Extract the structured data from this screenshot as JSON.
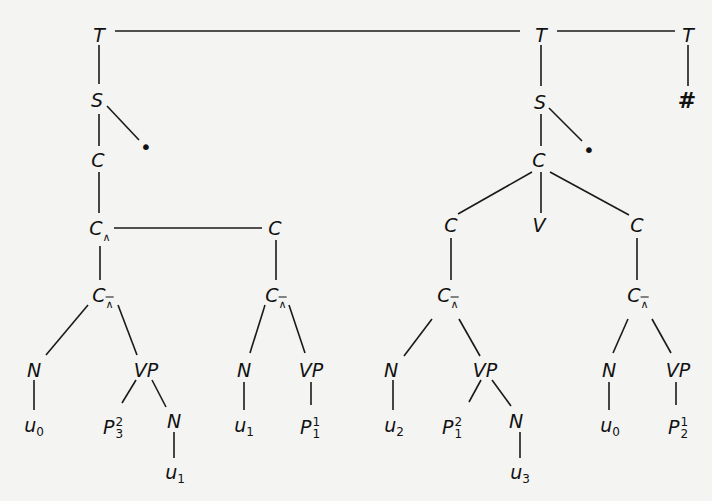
{
  "diagram": {
    "type": "tree",
    "edges_color": "#1a1a1a",
    "nodes": [
      {
        "id": "T1",
        "label": "T",
        "x": 99,
        "y": 35
      },
      {
        "id": "T2",
        "label": "T",
        "x": 541,
        "y": 35
      },
      {
        "id": "T3",
        "label": "T",
        "x": 688,
        "y": 35
      },
      {
        "id": "hash",
        "label": "#",
        "x": 687,
        "y": 101
      },
      {
        "id": "S1",
        "label": "S",
        "x": 97,
        "y": 100
      },
      {
        "id": "dot1",
        "label": "•",
        "x": 146,
        "y": 147
      },
      {
        "id": "C1",
        "label": "C",
        "x": 98,
        "y": 160
      },
      {
        "id": "Cw1",
        "label": "C",
        "sub": "∧",
        "x": 100,
        "y": 228
      },
      {
        "id": "C2",
        "label": "C",
        "x": 275,
        "y": 228
      },
      {
        "id": "Cwb1",
        "label": "C",
        "sub": "∧",
        "x": 103,
        "y": 295
      },
      {
        "id": "Cwb2",
        "label": "C",
        "sub": "∧",
        "x": 276,
        "y": 295
      },
      {
        "id": "N1",
        "label": "N",
        "x": 34,
        "y": 370
      },
      {
        "id": "VP1",
        "label": "VP",
        "x": 146,
        "y": 370
      },
      {
        "id": "u0a",
        "label": "u",
        "sub": "0",
        "x": 34,
        "y": 427
      },
      {
        "id": "P32",
        "label": "P",
        "sup": "2",
        "sub": "3",
        "x": 113,
        "y": 428
      },
      {
        "id": "N2",
        "label": "N",
        "x": 174,
        "y": 421
      },
      {
        "id": "u1a",
        "label": "u",
        "sub": "1",
        "x": 175,
        "y": 474
      },
      {
        "id": "N3",
        "label": "N",
        "x": 244,
        "y": 370
      },
      {
        "id": "VP2",
        "label": "VP",
        "x": 311,
        "y": 370
      },
      {
        "id": "u1b",
        "label": "u",
        "sub": "1",
        "x": 244,
        "y": 427
      },
      {
        "id": "P11",
        "label": "P",
        "sup": "1",
        "sub": "1",
        "x": 310,
        "y": 428
      },
      {
        "id": "S2",
        "label": "S",
        "x": 540,
        "y": 102
      },
      {
        "id": "dot2",
        "label": "•",
        "x": 589,
        "y": 150
      },
      {
        "id": "C3",
        "label": "C",
        "x": 539,
        "y": 160
      },
      {
        "id": "C4",
        "label": "C",
        "x": 451,
        "y": 225
      },
      {
        "id": "V",
        "label": "V",
        "x": 539,
        "y": 225
      },
      {
        "id": "C5",
        "label": "C",
        "x": 637,
        "y": 225
      },
      {
        "id": "Cwb3",
        "label": "C",
        "sub": "∧",
        "x": 448,
        "y": 295
      },
      {
        "id": "Cwb4",
        "label": "C",
        "sub": "∧",
        "x": 638,
        "y": 295
      },
      {
        "id": "N4",
        "label": "N",
        "x": 391,
        "y": 370
      },
      {
        "id": "VP3",
        "label": "VP",
        "x": 485,
        "y": 370
      },
      {
        "id": "u2",
        "label": "u",
        "sub": "2",
        "x": 394,
        "y": 427
      },
      {
        "id": "P12",
        "label": "P",
        "sup": "2",
        "sub": "1",
        "x": 452,
        "y": 428
      },
      {
        "id": "N5",
        "label": "N",
        "x": 516,
        "y": 421
      },
      {
        "id": "u3",
        "label": "u",
        "sub": "3",
        "x": 520,
        "y": 474
      },
      {
        "id": "N6",
        "label": "N",
        "x": 609,
        "y": 370
      },
      {
        "id": "VP4",
        "label": "VP",
        "x": 678,
        "y": 370
      },
      {
        "id": "u0b",
        "label": "u",
        "sub": "0",
        "x": 610,
        "y": 427
      },
      {
        "id": "P21",
        "label": "P",
        "sup": "1",
        "sub": "2",
        "x": 678,
        "y": 428
      }
    ],
    "edges": [
      [
        115,
        31,
        520,
        31
      ],
      [
        557,
        31,
        675,
        31
      ],
      [
        99,
        45,
        99,
        84
      ],
      [
        688,
        45,
        688,
        86
      ],
      [
        541,
        45,
        541,
        86
      ],
      [
        107,
        106,
        139,
        140
      ],
      [
        99,
        114,
        99,
        146
      ],
      [
        99,
        172,
        99,
        213
      ],
      [
        114,
        228,
        262,
        228
      ],
      [
        100,
        246,
        100,
        280
      ],
      [
        276,
        240,
        276,
        280
      ],
      [
        88,
        305,
        46,
        355
      ],
      [
        118,
        305,
        137,
        355
      ],
      [
        34,
        380,
        34,
        410
      ],
      [
        136,
        380,
        122,
        403
      ],
      [
        152,
        380,
        166,
        407
      ],
      [
        174,
        432,
        174,
        458
      ],
      [
        265,
        305,
        250,
        353
      ],
      [
        289,
        305,
        305,
        353
      ],
      [
        244,
        382,
        244,
        410
      ],
      [
        311,
        382,
        311,
        405
      ],
      [
        549,
        108,
        582,
        141
      ],
      [
        541,
        114,
        541,
        146
      ],
      [
        532,
        172,
        458,
        214
      ],
      [
        541,
        172,
        541,
        213
      ],
      [
        550,
        172,
        629,
        215
      ],
      [
        451,
        238,
        451,
        280
      ],
      [
        637,
        238,
        637,
        280
      ],
      [
        432,
        319,
        404,
        356
      ],
      [
        459,
        319,
        480,
        356
      ],
      [
        393,
        380,
        393,
        410
      ],
      [
        481,
        380,
        469,
        402
      ],
      [
        492,
        380,
        511,
        406
      ],
      [
        520,
        432,
        520,
        458
      ],
      [
        628,
        319,
        613,
        353
      ],
      [
        652,
        319,
        671,
        353
      ],
      [
        609,
        382,
        609,
        410
      ],
      [
        676,
        382,
        676,
        405
      ]
    ]
  }
}
